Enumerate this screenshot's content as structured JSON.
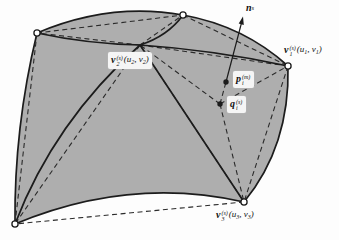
{
  "colors": {
    "page": "#fdfdfd",
    "surface": "#aeaeae",
    "line": "#1c1c1c",
    "dash": "#2a2a2a",
    "marker_fill": "#ffffff"
  },
  "labels": {
    "normal": {
      "base": "n",
      "sub": "s"
    },
    "v1": {
      "base": "v",
      "sup": "(s)",
      "sub": "1",
      "arg_open": "(",
      "arg1": "u",
      "arg1_sub": "1",
      "arg_sep": ", ",
      "arg2": "v",
      "arg2_sub": "1",
      "arg_close": ")"
    },
    "v2": {
      "base": "v",
      "sup": "(s)",
      "sub": "2",
      "arg_open": "(",
      "arg1": "u",
      "arg1_sub": "2",
      "arg_sep": ", ",
      "arg2": "v",
      "arg2_sub": "2",
      "arg_close": ")"
    },
    "v3": {
      "base": "v",
      "sup": "(s)",
      "sub": "3",
      "arg_open": "(",
      "arg1": "u",
      "arg1_sub": "3",
      "arg_sep": ", ",
      "arg2": "v",
      "arg2_sub": "3",
      "arg_close": ")"
    },
    "p": {
      "base": "p",
      "sup": "(m)",
      "sub": "i"
    },
    "q": {
      "base": "q",
      "sup": "(s)",
      "sub": "i"
    }
  }
}
